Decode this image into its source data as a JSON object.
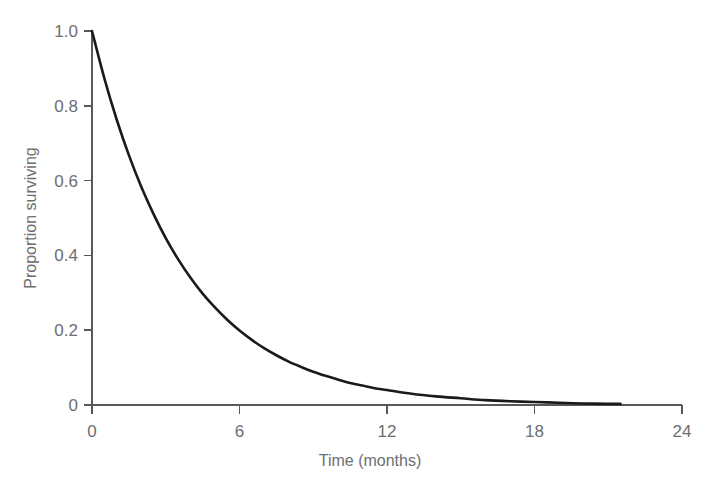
{
  "chart_data": {
    "type": "line",
    "title": "",
    "xlabel": "Time (months)",
    "ylabel": "Proportion surviving",
    "xlim": [
      0,
      24
    ],
    "ylim": [
      0,
      1.0
    ],
    "grid": false,
    "legend": "none",
    "xticks": [
      0,
      6,
      12,
      18,
      24
    ],
    "xticklabels": [
      "0",
      "6",
      "12",
      "18",
      "24"
    ],
    "yticks": [
      0,
      0.2,
      0.4,
      0.6,
      0.8,
      1.0
    ],
    "yticklabels": [
      "0",
      "0.2",
      "0.4",
      "0.6",
      "0.8",
      "1.0"
    ],
    "series": [
      {
        "name": "survival",
        "color": "#1a1a1a",
        "x": [
          0,
          0.5,
          1,
          1.5,
          2,
          2.5,
          3,
          3.5,
          4,
          4.5,
          5,
          5.5,
          6,
          6.5,
          7,
          7.5,
          8,
          8.5,
          9,
          9.5,
          10,
          10.5,
          11,
          11.5,
          12,
          13,
          14,
          15,
          16,
          17,
          18,
          19,
          20,
          21,
          21.5
        ],
        "y": [
          1.0,
          0.874,
          0.764,
          0.668,
          0.584,
          0.511,
          0.446,
          0.39,
          0.341,
          0.298,
          0.261,
          0.228,
          0.199,
          0.174,
          0.152,
          0.133,
          0.116,
          0.102,
          0.089,
          0.078,
          0.068,
          0.059,
          0.052,
          0.045,
          0.04,
          0.03,
          0.023,
          0.018,
          0.013,
          0.01,
          0.008,
          0.006,
          0.004,
          0.003,
          0.003
        ]
      }
    ],
    "annotations": []
  },
  "axes": {
    "y_title": "Proportion surviving",
    "x_title": "Time (months)"
  },
  "colors": {
    "curve": "#1a1a1a",
    "axis": "#58595b",
    "text": "#6d6e71",
    "background": "#ffffff"
  }
}
